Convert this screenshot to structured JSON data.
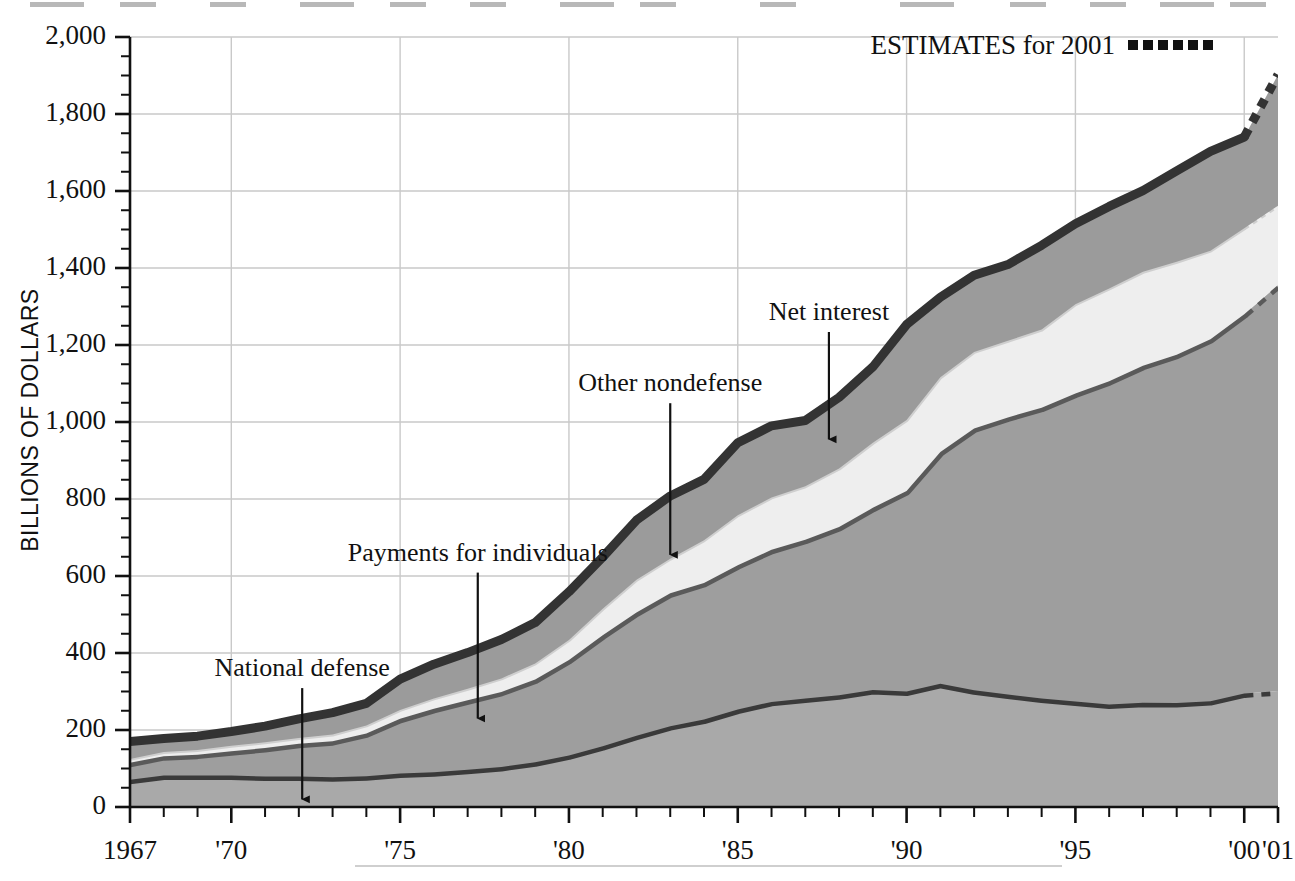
{
  "chart_data": {
    "type": "area",
    "title": "",
    "xlabel": "",
    "ylabel": "BILLIONS OF DOLLARS",
    "ylim": [
      0,
      2000
    ],
    "xlim": [
      1967,
      2001
    ],
    "grid": true,
    "stacked": true,
    "legend_position": "top-right",
    "y_ticks": [
      "0",
      "200",
      "400",
      "600",
      "800",
      "1,000",
      "1,200",
      "1,400",
      "1,600",
      "1,800",
      "2,000"
    ],
    "y_tick_values": [
      0,
      200,
      400,
      600,
      800,
      1000,
      1200,
      1400,
      1600,
      1800,
      2000
    ],
    "y_minor_tick_step": 50,
    "x_ticks": [
      "1967",
      "'70",
      "'75",
      "'80",
      "'85",
      "'90",
      "'95",
      "'00",
      "'01"
    ],
    "x_tick_values": [
      1967,
      1970,
      1975,
      1980,
      1985,
      1990,
      1995,
      2000,
      2001
    ],
    "x_gridline_values": [
      1970,
      1975,
      1980,
      1985,
      1990,
      1995,
      2000
    ],
    "y_gridline_values": [
      200,
      400,
      600,
      800,
      1000,
      1200,
      1400,
      1600,
      1800,
      2000
    ],
    "estimate_from_year": 2000,
    "legend": {
      "label": "ESTIMATES for 2001",
      "marker": "dotted-line-swatch"
    },
    "x": [
      1967,
      1968,
      1969,
      1970,
      1971,
      1972,
      1973,
      1974,
      1975,
      1976,
      1977,
      1978,
      1979,
      1980,
      1981,
      1982,
      1983,
      1984,
      1985,
      1986,
      1987,
      1988,
      1989,
      1990,
      1991,
      1992,
      1993,
      1994,
      1995,
      1996,
      1997,
      1998,
      1999,
      2000,
      2001
    ],
    "series": [
      {
        "name": "National defense",
        "color": "#a9a9a9",
        "edge_color": "#3a3a3a",
        "values": [
          71,
          82,
          82,
          82,
          79,
          79,
          77,
          80,
          87,
          90,
          97,
          104,
          116,
          134,
          158,
          185,
          210,
          227,
          253,
          273,
          282,
          290,
          304,
          300,
          320,
          303,
          292,
          282,
          274,
          266,
          271,
          270,
          275,
          295,
          301
        ]
      },
      {
        "name": "Payments for individuals",
        "color": "#9e9e9e",
        "edge_color": "#5a5a5a",
        "values": [
          44,
          50,
          54,
          63,
          74,
          85,
          94,
          111,
          142,
          165,
          180,
          195,
          215,
          248,
          288,
          320,
          345,
          355,
          375,
          395,
          412,
          437,
          473,
          521,
          602,
          680,
          720,
          755,
          800,
          840,
          875,
          905,
          940,
          985,
          1055
        ]
      },
      {
        "name": "Net interest",
        "color": "#eeeeee",
        "edge_color": "#cfcfcf",
        "values": [
          10,
          11,
          12,
          14,
          15,
          15,
          17,
          21,
          23,
          27,
          30,
          35,
          42,
          52,
          69,
          85,
          90,
          111,
          130,
          136,
          139,
          152,
          169,
          184,
          194,
          199,
          199,
          203,
          232,
          241,
          244,
          241,
          230,
          223,
          206
        ]
      },
      {
        "name": "Other nondefense",
        "color": "#9b9b9b",
        "edge_color": "#333333",
        "values": [
          45,
          35,
          36,
          37,
          42,
          50,
          57,
          57,
          80,
          89,
          94,
          101,
          106,
          125,
          134,
          155,
          163,
          158,
          188,
          186,
          171,
          185,
          197,
          248,
          208,
          199,
          198,
          219,
          209,
          213,
          211,
          236,
          258,
          237,
          340
        ]
      }
    ],
    "totals": [
      170,
      178,
      184,
      196,
      210,
      229,
      245,
      269,
      332,
      371,
      401,
      435,
      479,
      559,
      649,
      745,
      808,
      851,
      946,
      990,
      1004,
      1064,
      1143,
      1253,
      1324,
      1381,
      1409,
      1459,
      1515,
      1560,
      1601,
      1652,
      1703,
      1740,
      1902
    ],
    "annotations": [
      {
        "text": "National defense",
        "label_x": 1972.1,
        "label_y": 340,
        "arrow_to_x": 1972.1,
        "arrow_to_y": 20
      },
      {
        "text": "Payments for individuals",
        "label_x": 1977.3,
        "label_y": 640,
        "arrow_to_x": 1977.3,
        "arrow_to_y": 230
      },
      {
        "text": "Other nondefense",
        "label_x": 1983.0,
        "label_y": 1080,
        "arrow_to_x": 1983.0,
        "arrow_to_y": 655
      },
      {
        "text": "Net interest",
        "label_x": 1987.7,
        "label_y": 1265,
        "arrow_to_x": 1987.7,
        "arrow_to_y": 955
      }
    ]
  }
}
